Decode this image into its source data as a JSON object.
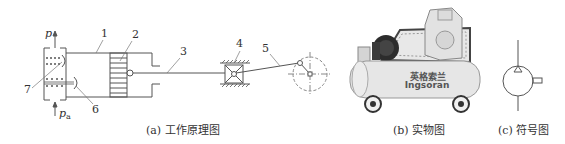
{
  "figure": {
    "panel_a": {
      "caption": "(a) 工作原理图",
      "labels": {
        "p_out": "p",
        "p_in": "p",
        "p_in_sub": "a",
        "parts": [
          "1",
          "2",
          "3",
          "4",
          "5",
          "6",
          "7"
        ]
      }
    },
    "panel_b": {
      "caption": "(b) 实物图",
      "brand_cn": "英格索兰",
      "brand_en": "Ingsoran"
    },
    "panel_c": {
      "caption": "(c) 符号图"
    },
    "colors": {
      "line": "#555555",
      "tank": "#e6e6e6",
      "dark": "#333333"
    }
  }
}
